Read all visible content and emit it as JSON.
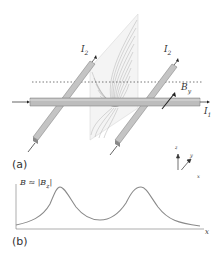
{
  "panel_a": {
    "label": "(a)",
    "current_labels": {
      "left_wire": "I",
      "left_wire_sub": "2",
      "right_wire": "I",
      "right_wire_sub": "2",
      "main_wire": "I",
      "main_wire_sub": "1"
    },
    "field_label": "B",
    "field_label_sub": "y",
    "axes": {
      "x": "x",
      "y": "y",
      "z": "z"
    }
  },
  "panel_b": {
    "label": "(b)",
    "ylabel": "B ≈ |B",
    "ylabel_sub": "z",
    "ylabel_close": "|",
    "xlabel": "x"
  },
  "colors": {
    "wire": "#b8b8b8",
    "wire_edge": "#777777",
    "contour": "#8a8a8a",
    "curve": "#8a8a8a",
    "dotted": "#555555"
  }
}
